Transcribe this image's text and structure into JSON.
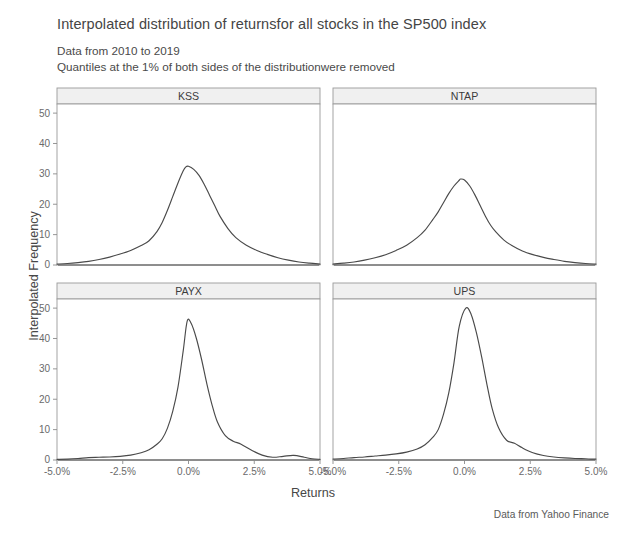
{
  "title": "Interpolated distribution of returnsfor all stocks in the SP500 index",
  "subtitle_line1": "Data from 2010 to 2019",
  "subtitle_line2": "Quantiles at the 1% of both sides of the distributionwere removed",
  "caption": "Data from Yahoo Finance",
  "axis": {
    "xlabel": "Returns",
    "ylabel": "Interpolated Frequency"
  },
  "chart_data": {
    "type": "line",
    "title": "Interpolated distribution of returnsfor all stocks in the SP500 index",
    "subtitle": "Data from 2010 to 2019; Quantiles at the 1% of both sides of the distributionwere removed",
    "xlabel": "Returns",
    "ylabel": "Interpolated Frequency",
    "xlim": [
      -5.0,
      5.0
    ],
    "ylim": [
      0,
      53
    ],
    "xtick_values": [
      -5.0,
      -2.5,
      0.0,
      2.5,
      5.0
    ],
    "xtick_labels": [
      "-5.0%",
      "-2.5%",
      "0.0%",
      "2.5%",
      "5.0%"
    ],
    "ytick_values": [
      0,
      10,
      20,
      30,
      40,
      50
    ],
    "ytick_labels": [
      "0",
      "10",
      "20",
      "30",
      "40",
      "50"
    ],
    "grid": false,
    "legend": "none",
    "facet_layout": {
      "rows": 2,
      "cols": 2
    },
    "panels": [
      {
        "label": "KSS",
        "row": 0,
        "col": 0,
        "peak_x": -0.1,
        "peak_y": 32.5,
        "x": [
          -5.0,
          -4.6,
          -4.2,
          -3.8,
          -3.4,
          -3.0,
          -2.6,
          -2.2,
          -1.8,
          -1.5,
          -1.2,
          -1.0,
          -0.8,
          -0.6,
          -0.4,
          -0.2,
          -0.1,
          0.0,
          0.2,
          0.4,
          0.6,
          0.8,
          1.0,
          1.2,
          1.5,
          1.8,
          2.2,
          2.6,
          3.0,
          3.4,
          3.8,
          4.2,
          4.6,
          5.0
        ],
        "y": [
          0.3,
          0.5,
          0.8,
          1.2,
          1.8,
          2.6,
          3.6,
          4.8,
          6.4,
          8.0,
          11.0,
          14.0,
          18.0,
          22.5,
          27.0,
          31.0,
          32.3,
          32.5,
          31.5,
          29.5,
          26.5,
          23.0,
          19.5,
          16.0,
          12.0,
          9.0,
          6.5,
          4.8,
          3.5,
          2.4,
          1.6,
          1.0,
          0.6,
          0.3
        ]
      },
      {
        "label": "NTAP",
        "row": 0,
        "col": 1,
        "peak_x": -0.15,
        "peak_y": 28.3,
        "x": [
          -5.0,
          -4.6,
          -4.2,
          -3.8,
          -3.4,
          -3.0,
          -2.6,
          -2.2,
          -1.8,
          -1.5,
          -1.2,
          -1.0,
          -0.8,
          -0.6,
          -0.4,
          -0.2,
          -0.15,
          0.0,
          0.2,
          0.4,
          0.6,
          0.8,
          1.0,
          1.2,
          1.5,
          1.8,
          2.2,
          2.6,
          3.0,
          3.4,
          3.8,
          4.2,
          4.6,
          5.0
        ],
        "y": [
          0.3,
          0.6,
          1.0,
          1.6,
          2.4,
          3.4,
          4.8,
          6.5,
          9.0,
          11.5,
          15.0,
          17.5,
          20.5,
          23.5,
          26.0,
          27.9,
          28.3,
          28.0,
          26.0,
          23.0,
          19.5,
          16.0,
          13.0,
          10.8,
          8.2,
          6.4,
          4.6,
          3.4,
          2.5,
          1.8,
          1.2,
          0.8,
          0.5,
          0.3
        ]
      },
      {
        "label": "PAYX",
        "row": 1,
        "col": 0,
        "peak_x": -0.05,
        "peak_y": 45.7,
        "x": [
          -5.0,
          -4.6,
          -4.2,
          -3.8,
          -3.4,
          -3.0,
          -2.6,
          -2.2,
          -1.8,
          -1.5,
          -1.2,
          -1.0,
          -0.8,
          -0.6,
          -0.4,
          -0.2,
          -0.05,
          0.1,
          0.3,
          0.5,
          0.7,
          0.9,
          1.1,
          1.4,
          1.7,
          2.0,
          2.4,
          2.8,
          3.2,
          3.6,
          4.0,
          4.4,
          4.7,
          5.0
        ],
        "y": [
          0.2,
          0.3,
          0.5,
          0.8,
          0.9,
          1.0,
          1.2,
          1.6,
          2.4,
          3.4,
          5.2,
          7.0,
          10.5,
          16.0,
          24.0,
          36.0,
          45.7,
          45.0,
          40.0,
          33.0,
          25.0,
          18.0,
          12.5,
          8.0,
          6.2,
          5.2,
          3.2,
          1.6,
          0.9,
          1.2,
          1.5,
          0.9,
          0.4,
          0.2
        ]
      },
      {
        "label": "UPS",
        "row": 1,
        "col": 1,
        "peak_x": 0.05,
        "peak_y": 50.0,
        "x": [
          -5.0,
          -4.6,
          -4.2,
          -3.8,
          -3.4,
          -3.0,
          -2.6,
          -2.2,
          -1.8,
          -1.5,
          -1.2,
          -1.0,
          -0.8,
          -0.6,
          -0.4,
          -0.2,
          0.05,
          0.25,
          0.45,
          0.65,
          0.85,
          1.05,
          1.3,
          1.6,
          1.9,
          2.2,
          2.6,
          3.0,
          3.4,
          3.8,
          4.2,
          4.6,
          4.8,
          5.0
        ],
        "y": [
          0.3,
          0.5,
          0.8,
          1.0,
          1.3,
          1.6,
          2.0,
          2.6,
          3.6,
          5.0,
          7.5,
          10.0,
          15.0,
          22.0,
          32.0,
          44.0,
          50.0,
          48.0,
          42.0,
          34.0,
          25.0,
          17.0,
          10.5,
          6.5,
          5.5,
          4.0,
          2.4,
          1.5,
          1.0,
          0.7,
          0.5,
          0.4,
          0.3,
          0.3
        ]
      }
    ]
  }
}
